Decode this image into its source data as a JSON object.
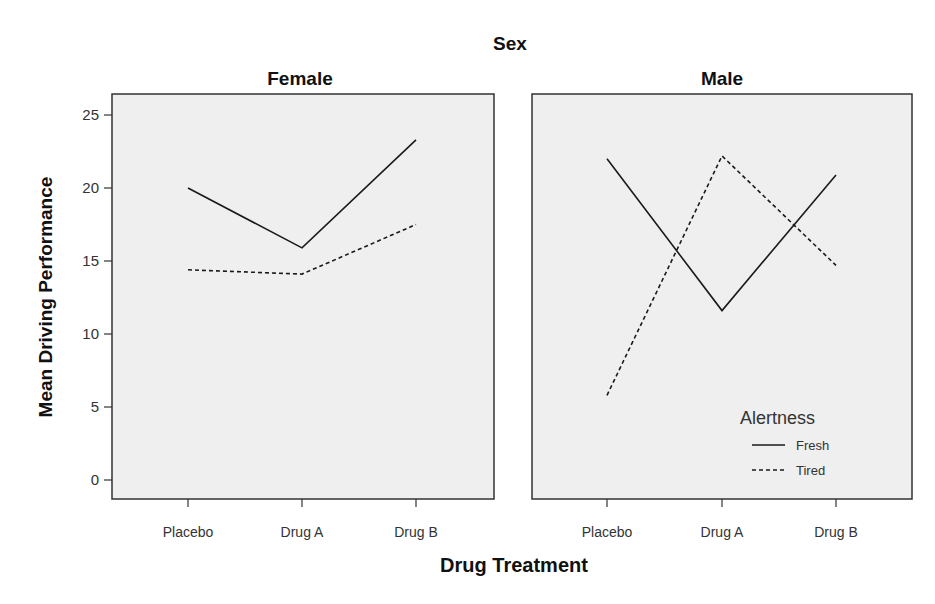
{
  "chart_data": {
    "type": "line",
    "title": "Sex",
    "xlabel": "Drug Treatment",
    "ylabel": "Mean Driving Performance",
    "categories": [
      "Placebo",
      "Drug A",
      "Drug B"
    ],
    "yticks": [
      "0",
      "5",
      "10",
      "15",
      "20",
      "25"
    ],
    "ylim": [
      -1.4,
      26.3
    ],
    "grid": false,
    "legend": {
      "title": "Alertness",
      "position": "lower right of Male panel",
      "entries": [
        "Fresh",
        "Tired"
      ]
    },
    "panels": [
      {
        "label": "Female",
        "series": [
          {
            "name": "Fresh",
            "style": "solid",
            "values": [
              20.0,
              15.9,
              23.3
            ]
          },
          {
            "name": "Tired",
            "style": "dashed",
            "values": [
              14.4,
              14.1,
              17.5
            ]
          }
        ]
      },
      {
        "label": "Male",
        "series": [
          {
            "name": "Fresh",
            "style": "solid",
            "values": [
              22.0,
              11.6,
              20.9
            ]
          },
          {
            "name": "Tired",
            "style": "dashed",
            "values": [
              5.8,
              22.2,
              14.7
            ]
          }
        ]
      }
    ]
  },
  "colors": {
    "panel_bg": "#efefef",
    "line": "#1a1a1a",
    "axis": "#333333"
  }
}
